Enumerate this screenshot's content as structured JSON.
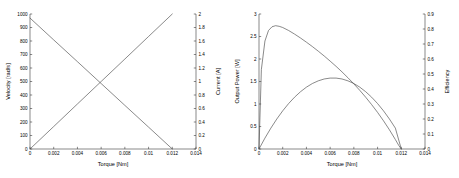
{
  "figure": {
    "background_color": "#ffffff",
    "line_color": "#4a4a4a",
    "axis_color": "#3a3a3a"
  },
  "chart_data": [
    {
      "type": "line",
      "panel": "left",
      "title": "",
      "xlabel": "Torque [Nm]",
      "ylabel": "Velocity [rad/s]",
      "y2label": "Current [A]",
      "xlim": [
        0,
        0.014
      ],
      "ylim": [
        0,
        1000
      ],
      "y2lim": [
        0,
        2
      ],
      "grid": false,
      "legend": "none",
      "xticks": [
        0,
        0.002,
        0.004,
        0.006,
        0.008,
        0.01,
        0.012,
        0.014
      ],
      "xticklabels": [
        "0",
        "0.002",
        "0.004",
        "0.006",
        "0.008",
        "0.01",
        "0.012",
        "0.014"
      ],
      "yticks": [
        0,
        100,
        200,
        300,
        400,
        500,
        600,
        700,
        800,
        900,
        1000
      ],
      "yticklabels": [
        "0",
        "100",
        "200",
        "300",
        "400",
        "500",
        "600",
        "700",
        "800",
        "900",
        "1000"
      ],
      "y2ticks": [
        0,
        0.2,
        0.4,
        0.6,
        0.8,
        1,
        1.2,
        1.4,
        1.6,
        1.8,
        2
      ],
      "y2ticklabels": [
        "0",
        "0.2",
        "0.4",
        "0.6",
        "0.8",
        "1",
        "1.2",
        "1.4",
        "1.6",
        "1.8",
        "2"
      ],
      "series": [
        {
          "name": "Velocity",
          "axis": "left",
          "x": [
            0,
            0.002,
            0.004,
            0.006,
            0.008,
            0.01,
            0.012
          ],
          "values": [
            970,
            808,
            647,
            485,
            323,
            162,
            0
          ]
        },
        {
          "name": "Current",
          "axis": "right",
          "x": [
            0,
            0.002,
            0.004,
            0.006,
            0.008,
            0.01,
            0.012
          ],
          "values": [
            0,
            0.333,
            0.667,
            1.0,
            1.333,
            1.667,
            2.0
          ]
        }
      ]
    },
    {
      "type": "line",
      "panel": "right",
      "title": "",
      "xlabel": "Torque [Nm]",
      "ylabel": "Output Power [W]",
      "y2label": "Efficiency",
      "xlim": [
        0,
        0.014
      ],
      "ylim": [
        0,
        3
      ],
      "y2lim": [
        0,
        0.9
      ],
      "grid": false,
      "legend": "none",
      "xticks": [
        0,
        0.002,
        0.004,
        0.006,
        0.008,
        0.01,
        0.012,
        0.014
      ],
      "xticklabels": [
        "0",
        "0.002",
        "0.004",
        "0.006",
        "0.008",
        "0.01",
        "0.012",
        "0.014"
      ],
      "yticks": [
        0,
        0.5,
        1,
        1.5,
        2,
        2.5,
        3
      ],
      "yticklabels": [
        "0",
        "0.5",
        "1",
        "1.5",
        "2",
        "2.5",
        "3"
      ],
      "y2ticks": [
        0,
        0.1,
        0.2,
        0.3,
        0.4,
        0.5,
        0.6,
        0.7,
        0.8,
        0.9
      ],
      "y2ticklabels": [
        "0",
        "0.1",
        "0.2",
        "0.3",
        "0.4",
        "0.5",
        "0.6",
        "0.7",
        "0.8",
        "0.9"
      ],
      "series": [
        {
          "name": "Output Power",
          "axis": "left",
          "x": [
            0,
            0.0005,
            0.001,
            0.0015,
            0.002,
            0.0025,
            0.003,
            0.0035,
            0.004,
            0.0045,
            0.005,
            0.0055,
            0.006,
            0.0065,
            0.007,
            0.0075,
            0.008,
            0.0085,
            0.009,
            0.0095,
            0.01,
            0.0105,
            0.011,
            0.0115,
            0.012
          ],
          "values": [
            0,
            0.242,
            0.464,
            0.666,
            0.848,
            1.01,
            1.151,
            1.273,
            1.374,
            1.455,
            1.515,
            1.556,
            1.576,
            1.576,
            1.556,
            1.515,
            1.455,
            1.374,
            1.273,
            1.151,
            1.01,
            0.848,
            0.666,
            0.464,
            0
          ]
        },
        {
          "name": "Efficiency",
          "axis": "right",
          "x": [
            0,
            0.0002,
            0.0005,
            0.0008,
            0.0011,
            0.0014,
            0.0017,
            0.002,
            0.0025,
            0.003,
            0.0035,
            0.004,
            0.0045,
            0.005,
            0.0055,
            0.006,
            0.0065,
            0.007,
            0.0075,
            0.008,
            0.0085,
            0.009,
            0.0095,
            0.01,
            0.0105,
            0.011,
            0.0115,
            0.0118,
            0.012
          ],
          "values": [
            0,
            0.53,
            0.72,
            0.79,
            0.815,
            0.822,
            0.818,
            0.81,
            0.79,
            0.766,
            0.74,
            0.712,
            0.683,
            0.652,
            0.62,
            0.586,
            0.551,
            0.514,
            0.475,
            0.434,
            0.391,
            0.345,
            0.296,
            0.244,
            0.188,
            0.128,
            0.063,
            0.022,
            0
          ]
        }
      ]
    }
  ]
}
